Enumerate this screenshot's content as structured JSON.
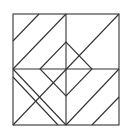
{
  "figure": {
    "stroke_color": "#333333",
    "background": "#ffffff",
    "square": {
      "x": 13,
      "y": 14,
      "w": 106,
      "h": 111
    },
    "diamond": [
      [
        40,
        69
      ],
      [
        66,
        42
      ],
      [
        92,
        69
      ],
      [
        66,
        96
      ]
    ],
    "lines": [
      [
        66,
        14,
        66,
        125
      ],
      [
        13,
        69,
        119,
        69
      ],
      [
        13,
        41,
        39,
        14
      ],
      [
        13,
        69,
        66,
        14
      ],
      [
        13,
        125,
        119,
        14
      ],
      [
        66,
        125,
        119,
        69
      ],
      [
        92,
        125,
        119,
        97
      ],
      [
        13,
        69,
        66,
        125
      ],
      [
        13,
        77,
        58,
        125
      ]
    ]
  }
}
